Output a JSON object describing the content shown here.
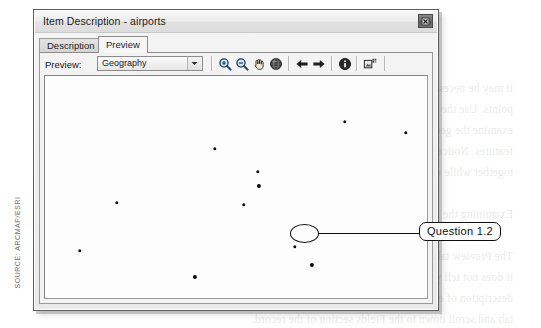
{
  "window": {
    "title": "Item Description - airports",
    "close_button": "close-button"
  },
  "tabs": [
    {
      "label": "Description",
      "active": false
    },
    {
      "label": "Preview",
      "active": true
    }
  ],
  "preview_bar": {
    "label": "Preview:",
    "dropdown": {
      "value": "Geography",
      "options": [
        "Geography",
        "Table"
      ]
    },
    "tools": [
      {
        "name": "zoom-in-icon",
        "title": "Zoom In"
      },
      {
        "name": "zoom-out-icon",
        "title": "Zoom Out"
      },
      {
        "name": "pan-hand-icon",
        "title": "Pan"
      },
      {
        "name": "full-extent-globe-icon",
        "title": "Full Extent"
      },
      {
        "name": "back-arrow-icon",
        "title": "Go Back To Previous Extent"
      },
      {
        "name": "forward-arrow-icon",
        "title": "Go To Next Extent"
      },
      {
        "name": "identify-info-icon",
        "title": "Identify"
      },
      {
        "name": "create-thumbnail-icon",
        "title": "Create Thumbnail"
      }
    ]
  },
  "map": {
    "name": "airports",
    "points": [
      {
        "x": 300,
        "y": 46,
        "big": false
      },
      {
        "x": 361,
        "y": 57,
        "big": false
      },
      {
        "x": 170,
        "y": 73,
        "big": false
      },
      {
        "x": 213,
        "y": 96,
        "big": false
      },
      {
        "x": 214,
        "y": 110,
        "big": true
      },
      {
        "x": 199,
        "y": 129,
        "big": false
      },
      {
        "x": 72,
        "y": 127,
        "big": false
      },
      {
        "x": 35,
        "y": 175,
        "big": false
      },
      {
        "x": 250,
        "y": 171,
        "big": false
      },
      {
        "x": 267,
        "y": 189,
        "big": true
      },
      {
        "x": 150,
        "y": 201,
        "big": true
      },
      {
        "x": 24,
        "y": 240,
        "big": false
      },
      {
        "x": 64,
        "y": 239,
        "big": false
      },
      {
        "x": 347,
        "y": 231,
        "big": false
      },
      {
        "x": 346,
        "y": 238,
        "big": false
      }
    ],
    "highlighted_point": {
      "x": 267,
      "y": 189
    }
  },
  "annotation": {
    "callout_label": "Question 1.2",
    "ellipse_name": "highlight-ellipse",
    "leader_name": "callout-leader-line"
  },
  "source_credit": "SOURCE: ARCMAP/ESRI",
  "bleed_text": "it may be necessary to zoom in or out to see all of the\npoints. Use the tools at the top of the Preview tab to\nexamine the geographic distribution of the airport\nfeatures. Notice that some of the points are clustered\ntogether while others are isolated from the rest.\n\nExamining the Data\n\nThe Preview tab shows you what the data looks like, but\nit does not tell you what the attributes mean. To see the\ndescription of each field, switch back to the Description\ntab and scroll down to the Fields section of the record.",
  "colors": {
    "window_border": "#5d5d5d",
    "titlebar": "#ededed",
    "panel": "#f3f3f3",
    "map_bg": "#fdfdfd",
    "point": "#0a0a0a",
    "annotation": "#0d0d0d",
    "source_text": "#6e6e6e"
  }
}
